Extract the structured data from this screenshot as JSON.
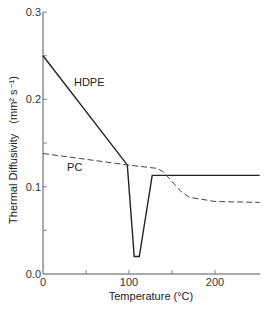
{
  "chart_data": {
    "type": "line",
    "title": "",
    "xlabel": "Temperature (°C)",
    "ylabel": "Thermal Diffusivity",
    "ylabel_units": "(mm² s⁻¹)",
    "xlim": [
      0,
      252
    ],
    "ylim": [
      0.0,
      0.3
    ],
    "x_ticks": [
      0,
      50,
      100,
      150,
      200
    ],
    "x_tick_labels": [
      "0",
      "",
      "100",
      "",
      "200"
    ],
    "y_ticks": [
      0.0,
      0.05,
      0.1,
      0.15,
      0.2,
      0.25,
      0.3
    ],
    "y_tick_labels": [
      "0.0",
      "",
      "0.1",
      "",
      "0.2",
      "",
      "0.3"
    ],
    "grid": false,
    "legend": "inline labels",
    "series": [
      {
        "name": "HDPE",
        "style": "solid",
        "x": [
          0,
          98,
          106,
          112,
          127,
          252
        ],
        "y": [
          0.25,
          0.125,
          0.02,
          0.02,
          0.113,
          0.113
        ],
        "label_pos": [
          36,
          0.215
        ]
      },
      {
        "name": "PC",
        "style": "dashed",
        "x": [
          0,
          98,
          133,
          140,
          160,
          170,
          200,
          252
        ],
        "y": [
          0.138,
          0.125,
          0.121,
          0.117,
          0.095,
          0.088,
          0.083,
          0.082
        ],
        "label_pos": [
          28,
          0.118
        ]
      }
    ]
  },
  "layout": {
    "plot_left": 43,
    "plot_bottom": 274,
    "px_per_x": 0.86,
    "px_per_y": 873,
    "axis_end_x": 260,
    "axis_top_y": 12
  }
}
